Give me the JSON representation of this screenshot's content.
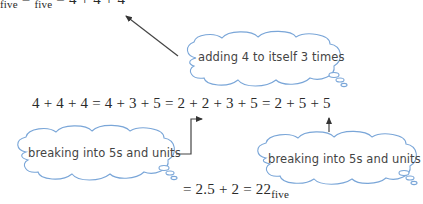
{
  "top_line": {
    "text": "× 3",
    "sub_a": "five",
    "eq": " = ",
    "sub_b": "five",
    "rest": " = 4 + 4 + 4",
    "clipped": true
  },
  "main_equation": {
    "text": "4 + 4 + 4 = 4 + 3 + 5 = 2 + 2 + 3 + 5 = 2 + 5 + 5"
  },
  "bottom_equation": {
    "text": "= 2.5 + 2 = 22",
    "subscript": "five"
  },
  "clouds": [
    {
      "id": "cloud-adding",
      "text": "adding 4 to itself 3 times"
    },
    {
      "id": "cloud-breaking-left",
      "text": "breaking into 5s and units"
    },
    {
      "id": "cloud-breaking-right",
      "text": "breaking into 5s and units"
    }
  ],
  "colors": {
    "cloud_stroke": "#7aa6d8",
    "arrow": "#333333",
    "text": "#2a2a2a",
    "cloud_text": "#444444"
  }
}
